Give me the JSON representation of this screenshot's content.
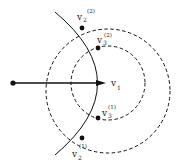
{
  "diagram": {
    "colors": {
      "stroke": "#111111",
      "background": "#ffffff"
    },
    "source_point": {
      "x": 13,
      "y": 83
    },
    "vector": {
      "from": [
        13,
        83
      ],
      "to": [
        106,
        83
      ]
    },
    "arc": {
      "path": "M 55 12 Q 140 83 55 155"
    },
    "circles": [
      {
        "name": "outer-dashed-circle",
        "cx": 108,
        "cy": 91,
        "r": 62
      },
      {
        "name": "inner-dashed-circle",
        "cx": 108,
        "cy": 83,
        "r": 37
      }
    ],
    "points": [
      {
        "name": "v2-2",
        "x": 82,
        "y": 28
      },
      {
        "name": "v3-2",
        "x": 98,
        "y": 48
      },
      {
        "name": "v3-1",
        "x": 98,
        "y": 118
      },
      {
        "name": "v2-1",
        "x": 82,
        "y": 138
      }
    ],
    "labels": {
      "v1": {
        "base": "v",
        "sub": "1"
      },
      "v2_2": {
        "base": "v",
        "sub": "2",
        "sup": "(2)"
      },
      "v3_2": {
        "base": "v",
        "sub": "3",
        "sup": "(2)"
      },
      "v3_1": {
        "base": "v",
        "sub": "3",
        "sup": "(1)"
      },
      "v2_1": {
        "base": "v",
        "sub": "2",
        "sup": "(1)"
      }
    }
  }
}
